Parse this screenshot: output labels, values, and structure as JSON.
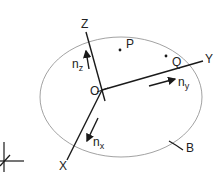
{
  "diagram": {
    "type": "coordinate-frame-on-body",
    "labels": {
      "z_axis": "Z",
      "y_axis": "Y",
      "x_axis": "X",
      "origin": "O",
      "point_p": "P",
      "point_q": "Q",
      "body": "B",
      "n_z_base": "n",
      "n_z_sub": "z",
      "n_y_base": "n",
      "n_y_sub": "y",
      "n_x_base": "n",
      "n_x_sub": "x"
    },
    "colors": {
      "line": "#1a1a1a",
      "ellipse": "#8a8a8a",
      "text": "#222222"
    }
  }
}
